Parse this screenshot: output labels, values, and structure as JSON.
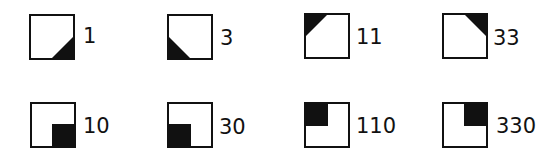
{
  "colors": {
    "stroke": "#111111",
    "fill": "#111111",
    "background": "#ffffff"
  },
  "rows": [
    {
      "kind": "triangle-corners",
      "items": [
        {
          "label": "1",
          "shape": "triangle",
          "corner": "bottom-right"
        },
        {
          "label": "3",
          "shape": "triangle",
          "corner": "bottom-left"
        },
        {
          "label": "11",
          "shape": "triangle",
          "corner": "top-left"
        },
        {
          "label": "33",
          "shape": "triangle",
          "corner": "top-right"
        }
      ]
    },
    {
      "kind": "square-corners",
      "items": [
        {
          "label": "10",
          "shape": "square",
          "corner": "bottom-right"
        },
        {
          "label": "30",
          "shape": "square",
          "corner": "bottom-left"
        },
        {
          "label": "110",
          "shape": "square",
          "corner": "top-left"
        },
        {
          "label": "330",
          "shape": "square",
          "corner": "top-right"
        }
      ]
    }
  ]
}
